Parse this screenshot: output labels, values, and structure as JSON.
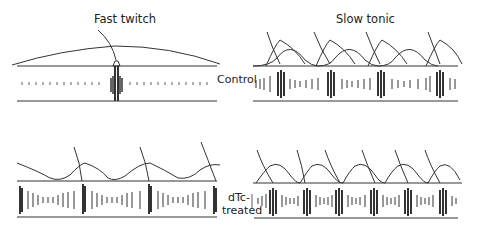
{
  "panels": {
    "fast_twitch": {
      "title": "Fast twitch"
    },
    "slow_tonic": {
      "title": "Slow tonic"
    }
  },
  "row_labels": {
    "control": "Control",
    "dtc_line1": "dTc-",
    "dtc_line2": "treated"
  },
  "colors": {
    "ink": "#333333",
    "background": "#ffffff"
  }
}
